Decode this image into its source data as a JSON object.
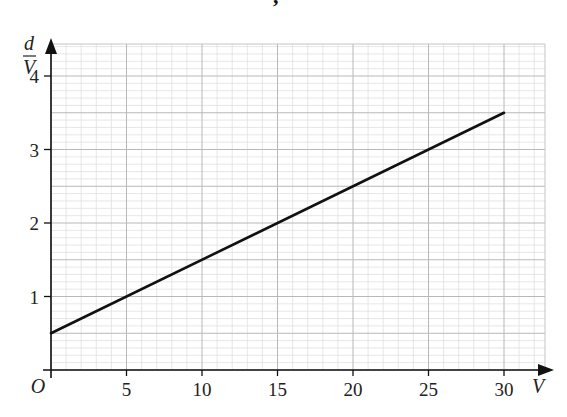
{
  "chart_data": {
    "type": "line",
    "title": "",
    "xlabel": "V",
    "ylabel_numerator": "d",
    "ylabel_denominator": "V",
    "origin_label": "O",
    "xlim": [
      0,
      30
    ],
    "ylim": [
      0,
      4
    ],
    "x_ticks": [
      5,
      10,
      15,
      20,
      25,
      30
    ],
    "x_tick_labels": [
      "5",
      "10",
      "15",
      "20",
      "25",
      "30"
    ],
    "y_ticks": [
      1,
      2,
      3,
      4
    ],
    "y_tick_labels": [
      "1",
      "2",
      "3",
      "4"
    ],
    "grid": true,
    "series": [
      {
        "name": "d/V vs V",
        "x": [
          0,
          30
        ],
        "y": [
          0.5,
          3.5
        ]
      }
    ]
  },
  "artifact_glyph": ","
}
